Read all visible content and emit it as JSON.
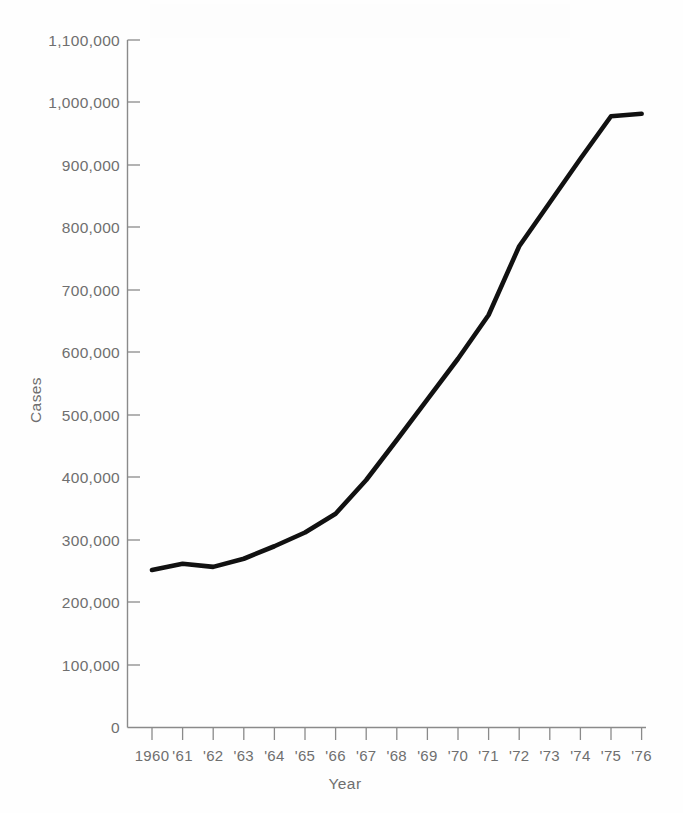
{
  "chart_data": {
    "type": "line",
    "title": "",
    "xlabel": "Year",
    "ylabel": "Cases",
    "x": [
      1960,
      1961,
      1962,
      1963,
      1964,
      1965,
      1966,
      1967,
      1968,
      1969,
      1970,
      1971,
      1972,
      1973,
      1974,
      1975,
      1976
    ],
    "xtick_labels": [
      "1960",
      "'61",
      "'62",
      "'63",
      "'64",
      "'65",
      "'66",
      "'67",
      "'68",
      "'69",
      "'70",
      "'71",
      "'72",
      "'73",
      "'74",
      "'75",
      "'76"
    ],
    "values": [
      252000,
      262000,
      257000,
      270000,
      290000,
      312000,
      342000,
      396000,
      460000,
      525000,
      590000,
      660000,
      770000,
      840000,
      910000,
      978000,
      982000
    ],
    "series": [
      {
        "name": "Cases",
        "values": [
          252000,
          262000,
          257000,
          270000,
          290000,
          312000,
          342000,
          396000,
          460000,
          525000,
          590000,
          660000,
          770000,
          840000,
          910000,
          978000,
          982000
        ]
      }
    ],
    "ylim": [
      0,
      1100000
    ],
    "yticks": [
      0,
      100000,
      200000,
      300000,
      400000,
      500000,
      600000,
      700000,
      800000,
      900000,
      1000000,
      1100000
    ],
    "ytick_labels": [
      "0",
      "100,000",
      "200,000",
      "300,000",
      "400,000",
      "500,000",
      "600,000",
      "700,000",
      "800,000",
      "900,000",
      "1,000,000",
      "1,100,000"
    ],
    "grid": false,
    "legend": false,
    "legend_position": "none",
    "line_color": "#111111",
    "axis_color": "#8a8a8a",
    "label_color": "#6f6f6f",
    "background_color": "#fefefe"
  },
  "axes": {
    "y_title": "Cases",
    "x_title": "Year"
  }
}
